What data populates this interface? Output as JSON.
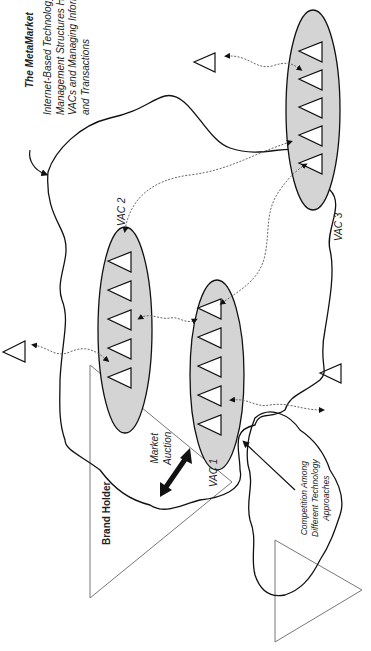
{
  "diagram": {
    "title": "The MetaMarket",
    "description_lines": [
      "Internet-Based Technology and",
      "Management Structures Holding",
      "VACs and Managing Information",
      "and Transactions"
    ],
    "nodes": {
      "vac1": "VAC 1",
      "vac2": "VAC 2",
      "vac3": "VAC 3",
      "brand_holder": "Brand Holder"
    },
    "labels": {
      "market_auction_line1": "Market",
      "market_auction_line2": "Auction",
      "competition_line1": "Competition Among",
      "competition_line2": "Different Technology",
      "competition_line3": "Approaches"
    },
    "colors": {
      "vac_fill": "#d4d4d4",
      "line": "#111111",
      "connector": "#666666"
    }
  }
}
